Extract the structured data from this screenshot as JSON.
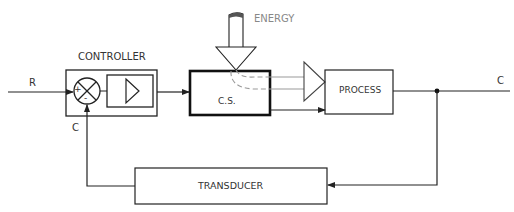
{
  "diagram": {
    "type": "control-loop-block-diagram",
    "labels": {
      "input": "R",
      "output": "C",
      "feedback": "C",
      "controller": "CONTROLLER",
      "energy": "ENERGY",
      "control_system": "C.S.",
      "process": "PROCESS",
      "transducer": "TRANSDUCER",
      "plus": "+",
      "minus": "-"
    },
    "colors": {
      "line": "#222222",
      "dashed": "#999999",
      "energy_text": "#888888"
    }
  }
}
